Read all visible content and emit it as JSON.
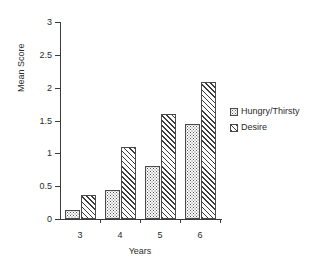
{
  "chart_data": {
    "type": "bar",
    "title": "",
    "xlabel": "Years",
    "ylabel": "Mean Score",
    "categories": [
      "3",
      "4",
      "5",
      "6"
    ],
    "series": [
      {
        "name": "Hungry/Thirsty",
        "pattern": "dots",
        "values": [
          0.14,
          0.44,
          0.8,
          1.44
        ]
      },
      {
        "name": "Desire",
        "pattern": "hatch",
        "values": [
          0.37,
          1.1,
          1.6,
          2.08
        ]
      }
    ],
    "ylim": [
      0,
      3
    ],
    "yticks": [
      "0",
      "0.5",
      "1",
      "1.5",
      "2",
      "2.5",
      "3"
    ],
    "ytick_values": [
      0,
      0.5,
      1,
      1.5,
      2,
      2.5,
      3
    ],
    "grid": false,
    "legend_position": "right",
    "axis_color": "#3b3b3b",
    "bar_edge_color": "#4a4a4a",
    "background": "#ffffff"
  }
}
